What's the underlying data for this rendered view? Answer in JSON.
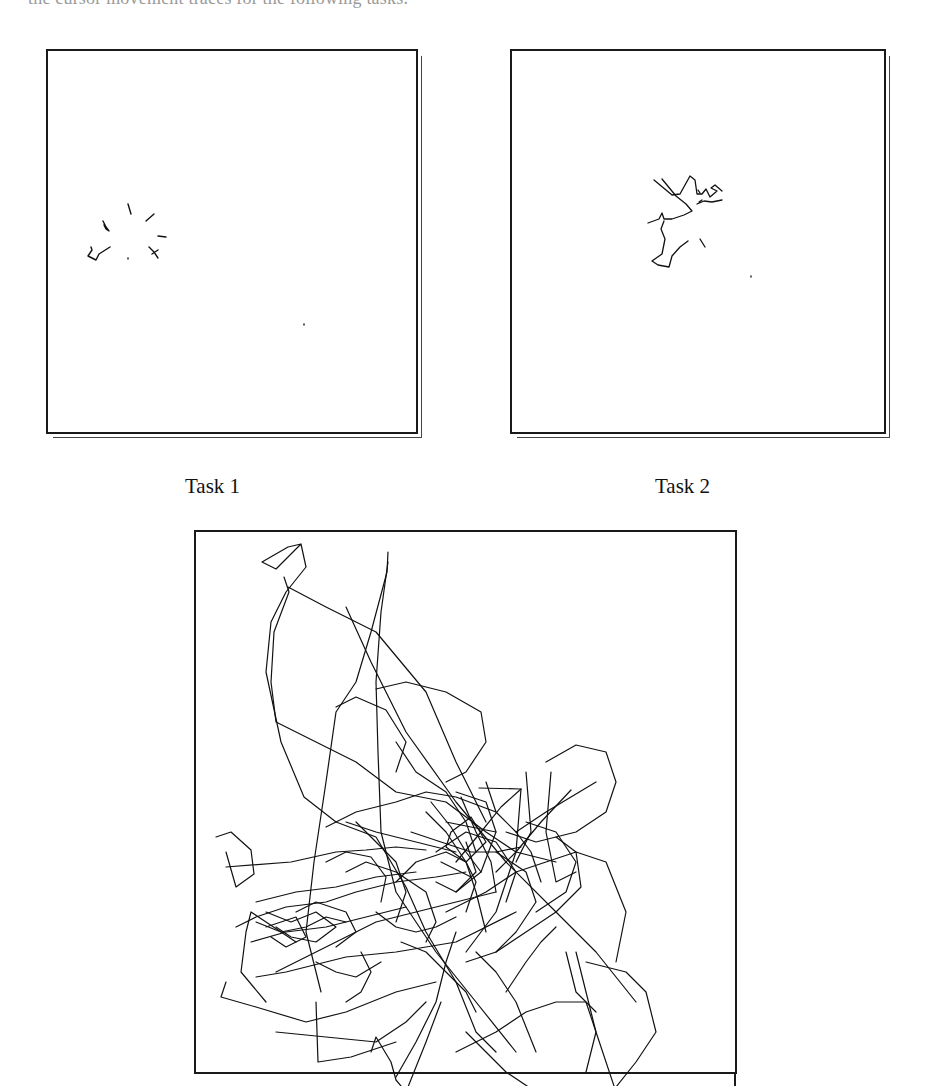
{
  "caption_clipped": "the cursor movement traces for the following tasks.",
  "figure": {
    "panels": [
      {
        "id": "task1",
        "label": "Task 1",
        "stroke_width": 1.4,
        "traces": [
          "M80 153 L83 163",
          "M98 170 L106 163",
          "M55 170 L58 176 L61 180 L58 178 L56 174",
          "M110 185 L118 186",
          "M40 205 L44 199 L43 196 M40 205 L48 209 L51 203 L62 196",
          "M80 207 L80 208",
          "M101 196 L106 201 L110 207 M104 203 L110 199",
          "M256 273 L256 274"
        ]
      },
      {
        "id": "task2",
        "label": "Task 2",
        "stroke_width": 1.3,
        "traces": [
          "M142 129 L160 144 L168 143 L178 125 L183 129 L185 143 L190 143 L194 138 L198 146 L205 140 L199 137 L203 134 L210 140",
          "M150 128 L164 145 L174 153 L180 160 L172 164 L160 168 L152 168 L150 162 L147 168 L136 172",
          "M152 170 L149 178 L153 188 L150 203 L140 210 L146 214 L157 216 L160 205 L168 196 L176 190",
          "M190 149 L187 151 M185 153 L192 150 L200 151 L210 149",
          "M188 188 L193 196",
          "M239 225 L239 226",
          "M186 139 L188 142"
        ]
      },
      {
        "id": "task3",
        "label": "",
        "stroke_width": 1.2,
        "traces": [
          "M105 12 L92 15 L66 30 L80 37 L105 12 L110 35 L90 60 L75 90 L70 140 L85 210 L108 265 L140 290 L180 305 L210 355 L230 400 L260 450 L280 500 L300 520",
          "M88 45 L93 60 L78 100 L75 150 L80 190 L120 210 L160 230 L200 260 L250 270 L290 300 L320 320 L360 330",
          "M192 20 L191 40 L175 100 L160 150 L140 180 L130 250 L118 330 L110 400 L125 460",
          "M192 30 L185 80 L180 150 L182 220 L185 300 L200 360 L240 420 L280 470 L320 520",
          "M150 75 L175 130 L210 200 L260 270 L310 330 L360 380 L400 420 L440 470",
          "M92 55 L130 75 L180 100 L230 160 L260 230 L290 290",
          "M180 157 L210 150 L250 160 L285 180 L290 210 L270 240 L250 250",
          "M140 175 L160 165 L190 178 L210 210 L200 240",
          "M283 256 L325 257 L320 320 L300 380 L270 420",
          "M260 330 L285 300 L305 275 L325 257",
          "M350 230 L380 213 L410 220 L420 250 L410 280 L380 300 L340 310 L310 300",
          "M330 240 L335 300 L320 330",
          "M355 240 L350 300 L360 350 L380 340",
          "M375 258 L345 290 L320 320 L300 340",
          "M400 250 L350 280 L320 300",
          "M360 305 L380 320 L385 355 L360 380 L330 400 L300 420 L270 430",
          "M20 305 L35 300 L55 318 L58 342 L40 355 L30 320",
          "M30 335 L95 330 L140 320 L170 318 L200 315 L230 318",
          "M60 445 L90 440 L150 425 L200 420 L260 410 L320 380",
          "M80 440 L110 425 L140 410 L180 390 L220 380 L260 370 L300 360",
          "M100 410 L70 390 L55 380 L50 400 L45 440 L70 470",
          "M30 450 L25 465 L60 475 L110 490 L150 480 L200 460 L240 450",
          "M80 500 L130 505 L180 510 L210 490 L230 470",
          "M120 470 L122 530 L155 525 L200 510",
          "M175 520 L180 505 L195 530 L200 548 L210 560 L230 510 L245 470",
          "M200 545 L220 510 L240 470 L250 430 L260 400",
          "M270 500 L290 520 L310 540 L340 560 L380 570 L420 555 L440 530 L460 500 L450 460 L430 440 L390 430",
          "M420 560 L400 500 L390 460 L380 420",
          "M260 520 L300 500 L330 480 L360 470 L390 470 L400 500 L390 540",
          "M340 520 L320 470 L300 440 L280 420",
          "M250 380 L290 360 L320 340 L350 330 L380 320 L410 330 L430 380 L420 430",
          "M370 420 L380 460 L400 480",
          "M40 395 L60 385 L90 375 L130 370 L160 360 L200 350 L240 345 L270 340",
          "M55 410 L90 400 L130 395 L170 385 L210 375",
          "M60 370 L100 360 L140 355 L180 345 L220 340",
          "M130 295 L160 280 L200 270 L230 260 L260 265 L300 280",
          "M200 210 L220 240 L250 260 L270 290 L280 320",
          "M150 290 L180 300 L220 310 L260 320",
          "M230 280 L250 300 L270 330 L280 360 L290 400",
          "M260 260 L290 270 L300 300 L285 340 L260 360",
          "M240 320 L270 300 L300 310 L320 340 L310 370",
          "M200 350 L220 330 L250 320 L270 330 L280 350 L270 380",
          "M255 300 L275 285 L290 310 L270 330 L250 315 Z",
          "M240 350 L260 360 L280 340 L270 310 M245 330 L275 345",
          "M70 380 L95 390 L120 380 L140 395 L120 410 L95 405 L80 395",
          "M100 380 L120 370 L150 380 L160 400 L140 415",
          "M60 390 L85 400 L110 395 L130 385 L150 390",
          "M70 395 L100 385 L110 405 L90 415 L75 405",
          "M160 290 L180 310 L200 330 L210 360 L200 390",
          "M150 340 L170 330 L200 340 L230 360 L240 390 L230 410",
          "M130 330 L150 320 L175 325 L190 345 L185 370",
          "M300 320 L330 340 L340 370 L320 400 L300 420",
          "M330 290 L360 300 L380 330 L370 360 L340 380",
          "M290 250 L300 280 L320 300 L335 320 L345 350",
          "M265 265 L280 300 L295 330 L300 360",
          "M235 270 L255 295 L270 320 L285 340 M250 290 L300 300",
          "M215 300 L245 310 L275 320 L300 320 L325 315",
          "M180 380 L200 395 L220 400 L240 395 L260 385",
          "M120 430 L140 440 L160 445 L185 430",
          "M205 410 L230 420 L250 440 L270 460 L280 480",
          "M165 420 L175 440 L165 460 L150 470",
          "M310 460 L330 430 L345 410 L360 395"
        ]
      }
    ]
  }
}
